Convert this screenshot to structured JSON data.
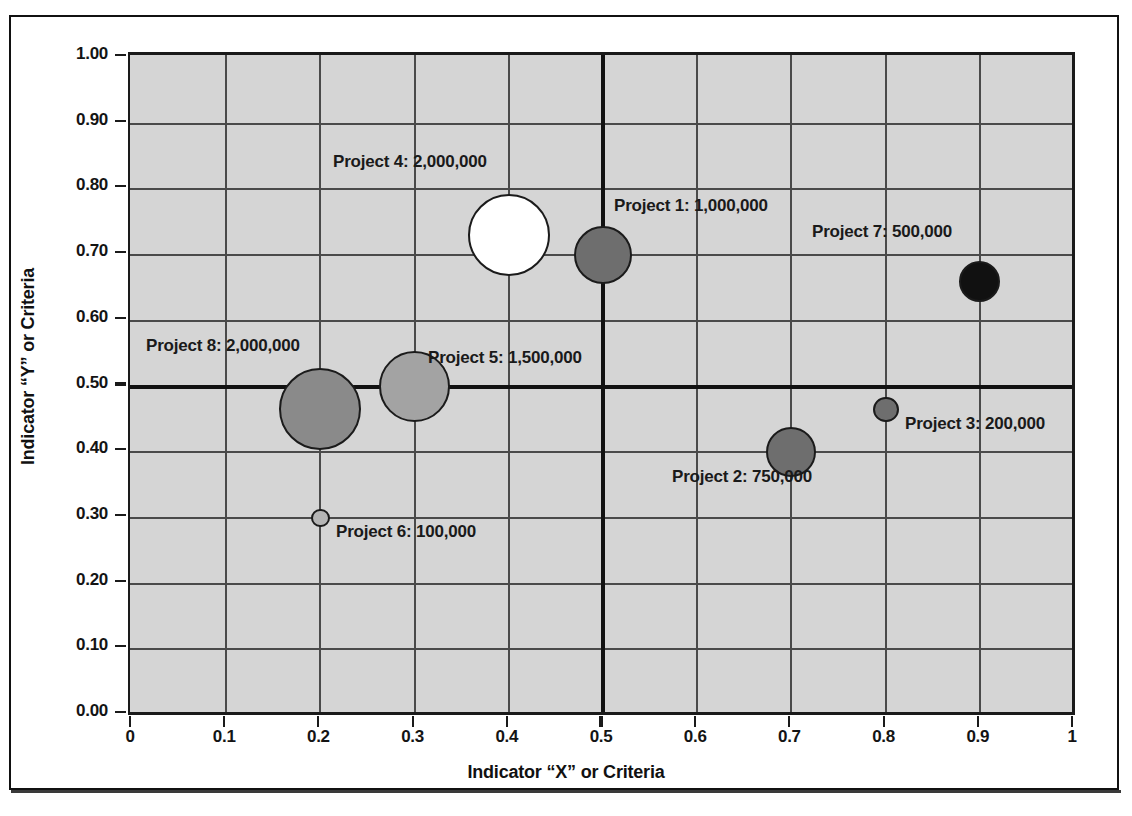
{
  "chart_data": {
    "type": "scatter",
    "title": "",
    "xlabel": "Indicator “X” or Criteria",
    "ylabel": "Indicator “Y” or Criteria",
    "xlim": [
      0,
      1
    ],
    "ylim": [
      0,
      1
    ],
    "grid": true,
    "legend": "none",
    "xticks": [
      "0",
      "0.1",
      "0.2",
      "0.3",
      "0.4",
      "0.5",
      "0.6",
      "0.7",
      "0.8",
      "0.9",
      "1"
    ],
    "yticks": [
      "0.00",
      "0.10",
      "0.20",
      "0.30",
      "0.40",
      "0.50",
      "0.60",
      "0.70",
      "0.80",
      "0.90",
      "1.00"
    ],
    "reference_lines": {
      "x": 0.5,
      "y": 0.5
    },
    "bubbles": [
      {
        "name": "Project 1",
        "value": "1,000,000",
        "value_num": 1000000,
        "x": 0.5,
        "y": 0.7,
        "color": "#6e6e6e",
        "label": "Project 1:  1,000,000"
      },
      {
        "name": "Project 2",
        "value": "750,000",
        "value_num": 750000,
        "x": 0.7,
        "y": 0.4,
        "color": "#6e6e6e",
        "label": "Project 2:  750,000"
      },
      {
        "name": "Project 3",
        "value": "200,000",
        "value_num": 200000,
        "x": 0.8,
        "y": 0.465,
        "color": "#6e6e6e",
        "label": "Project 3:  200,000"
      },
      {
        "name": "Project 4",
        "value": "2,000,000",
        "value_num": 2000000,
        "x": 0.4,
        "y": 0.73,
        "color": "#ffffff",
        "label": "Project 4:  2,000,000"
      },
      {
        "name": "Project 5",
        "value": "1,500,000",
        "value_num": 1500000,
        "x": 0.3,
        "y": 0.5,
        "color": "#a3a3a3",
        "label": "Project 5:  1,500,000"
      },
      {
        "name": "Project 6",
        "value": "100,000",
        "value_num": 100000,
        "x": 0.2,
        "y": 0.3,
        "color": "#b5b5b5",
        "label": "Project 6:  100,000"
      },
      {
        "name": "Project 7",
        "value": "500,000",
        "value_num": 500000,
        "x": 0.9,
        "y": 0.66,
        "color": "#111111",
        "label": "Project 7:  500,000"
      },
      {
        "name": "Project 8",
        "value": "2,000,000",
        "value_num": 2000000,
        "x": 0.2,
        "y": 0.465,
        "color": "#8a8a8a",
        "label": "Project 8:  2,000,000"
      }
    ]
  },
  "axes": {
    "x_title": "Indicator “X” or Criteria",
    "y_title": "Indicator “Y” or Criteria",
    "x_ticks": [
      "0",
      "0.1",
      "0.2",
      "0.3",
      "0.4",
      "0.5",
      "0.6",
      "0.7",
      "0.8",
      "0.9",
      "1"
    ],
    "y_ticks": [
      "0.00",
      "0.10",
      "0.20",
      "0.30",
      "0.40",
      "0.50",
      "0.60",
      "0.70",
      "0.80",
      "0.90",
      "1.00"
    ]
  },
  "labels": {
    "project1": "Project 1:  1,000,000",
    "project2": "Project 2:  750,000",
    "project3": "Project 3:  200,000",
    "project4": "Project 4:  2,000,000",
    "project5": "Project 5:  1,500,000",
    "project6": "Project 6:  100,000",
    "project7": "Project 7:  500,000",
    "project8": "Project 8:  2,000,000"
  },
  "colors": {
    "plot_background": "#d5d5d5",
    "gridline": "#4a4a4a",
    "major_line": "#111111",
    "frame": "#111111",
    "text": "#141414"
  }
}
